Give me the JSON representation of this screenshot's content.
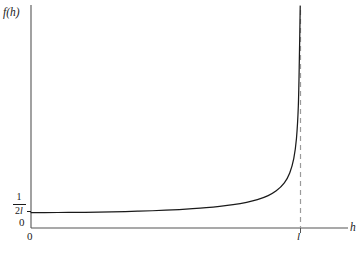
{
  "chart_data": {
    "type": "line",
    "title": "",
    "subtitle": "",
    "xlabel": "h",
    "ylabel": "f(h)",
    "xlim": [
      0,
      1.15
    ],
    "ylim": [
      0,
      1.0
    ],
    "grid": false,
    "legend": null,
    "x_tick_labels": [
      "0",
      "l"
    ],
    "x_tick_values": [
      0,
      1
    ],
    "y_tick_labels": [
      "0",
      "1/2l"
    ],
    "y_tick_values": [
      0,
      0.0694
    ],
    "y_tick_fraction": {
      "numerator": "1",
      "denominator_number": "2",
      "denominator_symbol": "l"
    },
    "origin_label": "0",
    "annotations": [
      {
        "name": "vertical-asymptote",
        "style": "dashed",
        "x": 1,
        "label": "l"
      }
    ],
    "series": [
      {
        "name": "f(h)",
        "style": "solid",
        "color": "#1a1a1a",
        "description": "density rising from 1/2l at h=0 with a vertical asymptote at h=l",
        "x": [
          0.0,
          0.05,
          0.1,
          0.15,
          0.2,
          0.25,
          0.3,
          0.35,
          0.4,
          0.45,
          0.5,
          0.55,
          0.6,
          0.65,
          0.7,
          0.75,
          0.8,
          0.84,
          0.88,
          0.91,
          0.94,
          0.96,
          0.975,
          0.985,
          0.992,
          0.996,
          0.999
        ],
        "y": [
          0.0694,
          0.0695,
          0.0698,
          0.0702,
          0.0708,
          0.0717,
          0.0728,
          0.0741,
          0.0757,
          0.0777,
          0.0802,
          0.0831,
          0.0868,
          0.0913,
          0.0972,
          0.1049,
          0.1157,
          0.1278,
          0.1461,
          0.1673,
          0.2035,
          0.2478,
          0.3124,
          0.403,
          0.5505,
          0.7772,
          1.0
        ]
      }
    ]
  },
  "axes": {
    "y_axis_label": "f(h)",
    "x_axis_label": "h",
    "x_origin_label": "0",
    "y_origin_label": "0",
    "x_asymptote_label": "l"
  },
  "colors": {
    "curve": "#1a1a1a",
    "axis": "#555555",
    "asymptote": "#9a9a9a",
    "background": "#ffffff",
    "text": "#1a1a1a"
  }
}
